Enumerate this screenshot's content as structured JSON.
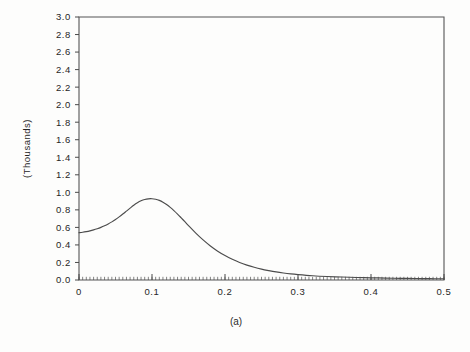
{
  "figure": {
    "caption": "(a)",
    "background_color": "#fdfdfc",
    "line_color": "#4c4c4c"
  },
  "chart_data": {
    "type": "line",
    "title": "",
    "subtitle": "",
    "xlabel": "",
    "ylabel": "(Thousands)",
    "xlim": [
      0,
      0.5
    ],
    "ylim": [
      0,
      3.0
    ],
    "grid": false,
    "legend": null,
    "annotations": [
      "(a)"
    ],
    "x_tick_labels": [
      "0",
      "0.1",
      "0.2",
      "0.3",
      "0.4",
      "0.5"
    ],
    "x_tick_values": [
      0,
      0.1,
      0.2,
      0.3,
      0.4,
      0.5
    ],
    "x_minor_tick_step": 0.005,
    "y_tick_labels": [
      "0.0",
      "0.2",
      "0.4",
      "0.6",
      "0.8",
      "1.0",
      "1.2",
      "1.4",
      "1.6",
      "1.8",
      "2.0",
      "2.2",
      "2.4",
      "2.6",
      "2.8",
      "3.0"
    ],
    "y_tick_values": [
      0.0,
      0.2,
      0.4,
      0.6,
      0.8,
      1.0,
      1.2,
      1.4,
      1.6,
      1.8,
      2.0,
      2.2,
      2.4,
      2.6,
      2.8,
      3.0
    ],
    "series": [
      {
        "name": "curve-a",
        "x": [
          0.0,
          0.005,
          0.01,
          0.015,
          0.02,
          0.025,
          0.03,
          0.035,
          0.04,
          0.045,
          0.05,
          0.055,
          0.06,
          0.065,
          0.07,
          0.075,
          0.08,
          0.085,
          0.09,
          0.095,
          0.1,
          0.105,
          0.11,
          0.115,
          0.12,
          0.125,
          0.13,
          0.135,
          0.14,
          0.145,
          0.15,
          0.16,
          0.17,
          0.18,
          0.19,
          0.2,
          0.21,
          0.22,
          0.23,
          0.24,
          0.25,
          0.26,
          0.27,
          0.28,
          0.29,
          0.3,
          0.32,
          0.34,
          0.36,
          0.38,
          0.4,
          0.42,
          0.44,
          0.46,
          0.48,
          0.5
        ],
        "y": [
          0.54,
          0.545,
          0.552,
          0.561,
          0.572,
          0.585,
          0.6,
          0.618,
          0.639,
          0.663,
          0.69,
          0.72,
          0.752,
          0.786,
          0.82,
          0.853,
          0.881,
          0.903,
          0.918,
          0.926,
          0.927,
          0.921,
          0.908,
          0.888,
          0.861,
          0.829,
          0.792,
          0.752,
          0.709,
          0.665,
          0.621,
          0.535,
          0.457,
          0.388,
          0.329,
          0.279,
          0.236,
          0.2,
          0.17,
          0.145,
          0.124,
          0.107,
          0.092,
          0.08,
          0.07,
          0.062,
          0.049,
          0.04,
          0.034,
          0.029,
          0.025,
          0.022,
          0.019,
          0.017,
          0.015,
          0.014
        ]
      }
    ]
  },
  "plot_geometry": {
    "left": 79,
    "right": 444,
    "top": 17,
    "bottom": 280
  }
}
